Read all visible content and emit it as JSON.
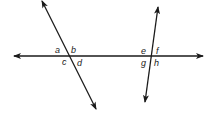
{
  "diagram": {
    "colors": {
      "line": "#1a1a1a",
      "text": "#222222",
      "background": "#ffffff"
    },
    "lines": {
      "horizontal": {
        "x1": 14,
        "y1": 56,
        "x2": 203,
        "y2": 56,
        "arrows": "both"
      },
      "left_transversal": {
        "x1": 42,
        "y1": 0,
        "x2": 96,
        "y2": 109,
        "arrows": "both"
      },
      "right_transversal": {
        "x1": 158,
        "y1": 7,
        "x2": 145,
        "y2": 102,
        "arrows": "both"
      }
    },
    "intersections": [
      {
        "name": "left",
        "labels": {
          "top_left": "a",
          "top_right": "b",
          "bottom_left": "c",
          "bottom_right": "d"
        }
      },
      {
        "name": "right",
        "labels": {
          "top_left": "e",
          "top_right": "f",
          "bottom_left": "g",
          "bottom_right": "h"
        }
      }
    ]
  }
}
